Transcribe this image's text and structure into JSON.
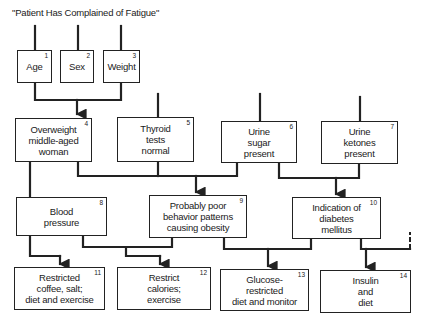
{
  "title": "\"Patient Has Complained of Fatigue\"",
  "nodes": [
    {
      "id": 1,
      "num": "1",
      "label": "Age"
    },
    {
      "id": 2,
      "num": "2",
      "label": "Sex"
    },
    {
      "id": 3,
      "num": "3",
      "label": "Weight"
    },
    {
      "id": 4,
      "num": "4",
      "label": "Overweight\nmiddle-aged\nwoman"
    },
    {
      "id": 5,
      "num": "5",
      "label": "Thyroid\ntests\nnormal"
    },
    {
      "id": 6,
      "num": "6",
      "label": "Urine\nsugar\npresent"
    },
    {
      "id": 7,
      "num": "7",
      "label": "Urine\nketones\npresent"
    },
    {
      "id": 8,
      "num": "8",
      "label": "Blood\npressure"
    },
    {
      "id": 9,
      "num": "9",
      "label": "Probably poor\nbehavior patterns\ncausing obesity"
    },
    {
      "id": 10,
      "num": "10",
      "label": "Indication of\ndiabetes\nmellitus"
    },
    {
      "id": 11,
      "num": "11",
      "label": "Restricted\ncoffee, salt;\ndiet and exercise"
    },
    {
      "id": 12,
      "num": "12",
      "label": "Restrict\ncalories;\nexercise"
    },
    {
      "id": 13,
      "num": "13",
      "label": "Glucose-\nrestricted\ndiet and monitor"
    },
    {
      "id": 14,
      "num": "14",
      "label": "Insulin\nand\ndiet"
    }
  ],
  "edges": [
    {
      "from": [
        1,
        2,
        3
      ],
      "to": 4
    },
    {
      "from": [
        4,
        5,
        6
      ],
      "to": 9
    },
    {
      "from": [
        6,
        7
      ],
      "to": 10
    },
    {
      "from": [
        4
      ],
      "to": 8
    },
    {
      "from": [
        8
      ],
      "to": 11
    },
    {
      "from": [
        8,
        9
      ],
      "to": 12
    },
    {
      "from": [
        9,
        10
      ],
      "to": 13
    },
    {
      "from": [
        10
      ],
      "to": 14
    }
  ]
}
